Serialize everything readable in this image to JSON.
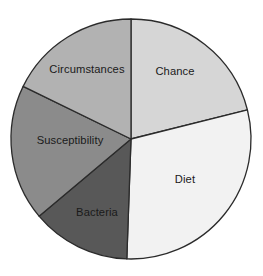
{
  "chart_data": {
    "type": "pie",
    "title": "",
    "subtitle": "",
    "xlabel": "",
    "ylabel": "",
    "legend_position": "none",
    "labels_inside_slices": true,
    "grid": false,
    "background_color": "#ffffff",
    "outline_color": "#2b2b2b",
    "label_color": "#1a1a1a",
    "center_x": 131,
    "center_y": 139,
    "radius": 120,
    "start_angle_deg": 0,
    "direction": "clockwise",
    "categories": [
      "Chance",
      "Diet",
      "Bacteria",
      "Susceptibility",
      "Circumstances"
    ],
    "values": [
      21.1,
      29.4,
      13.3,
      18.3,
      17.9
    ],
    "units": "percent",
    "slices": [
      {
        "label": "Chance",
        "value": 21.1,
        "start_angle_deg": 0,
        "end_angle_deg": 76,
        "color": "#d6d6d6",
        "label_x": 175,
        "label_y": 72
      },
      {
        "label": "Diet",
        "value": 29.4,
        "start_angle_deg": 76,
        "end_angle_deg": 182,
        "color": "#f2f2f2",
        "label_x": 185,
        "label_y": 180
      },
      {
        "label": "Bacteria",
        "value": 13.3,
        "start_angle_deg": 182,
        "end_angle_deg": 230,
        "color": "#585858",
        "label_x": 97,
        "label_y": 213
      },
      {
        "label": "Susceptibility",
        "value": 18.3,
        "start_angle_deg": 230,
        "end_angle_deg": 296,
        "color": "#8b8b8b",
        "label_x": 70,
        "label_y": 141
      },
      {
        "label": "Circumstances",
        "value": 17.9,
        "start_angle_deg": 296,
        "end_angle_deg": 360,
        "color": "#b2b2b2",
        "label_x": 87,
        "label_y": 70
      }
    ]
  }
}
